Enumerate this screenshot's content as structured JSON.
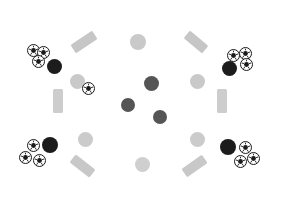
{
  "scene": {
    "title": "Scattered Sports Objects",
    "width": 284,
    "height": 217,
    "background_color": "#ffffff",
    "object_counts": {
      "soccer_balls": 10,
      "dark_balls": 8,
      "light_balls": 6,
      "gray_bars": 6
    }
  },
  "palette": {
    "soccer_ball_fill": "#fdfdfd",
    "soccer_ball_outline": "#1b1b1b",
    "dark_ball_black": "#1c1c1c",
    "dark_ball_gray": "#555555",
    "light_ball": "#c9c9c9",
    "light_ball_pale": "#d6d6d6",
    "bar_gray": "#c4c4c4",
    "bar_gray_light": "#d2d2d2"
  },
  "objects": [
    {
      "id": "soccer-tl-1",
      "kind": "soccer-ball",
      "label": "Soccer ball top-left upper",
      "x": 33,
      "y": 50,
      "size": 13
    },
    {
      "id": "soccer-tl-2",
      "kind": "soccer-ball",
      "label": "Soccer ball top-left right",
      "x": 43,
      "y": 52,
      "size": 13
    },
    {
      "id": "soccer-tl-3",
      "kind": "soccer-ball",
      "label": "Soccer ball top-left lower",
      "x": 38,
      "y": 61,
      "size": 13
    },
    {
      "id": "ball-tl-dark",
      "kind": "dark-ball",
      "label": "Black ball top-left",
      "x": 54,
      "y": 66,
      "size": 15,
      "color": "#1c1c1c"
    },
    {
      "id": "ball-tlm-light",
      "kind": "light-ball",
      "label": "Light ball top-left-mid",
      "x": 77,
      "y": 81,
      "size": 15,
      "color": "#c9c9c9"
    },
    {
      "id": "soccer-tlm",
      "kind": "soccer-ball",
      "label": "Soccer ball top-left-mid",
      "x": 88,
      "y": 88,
      "size": 13
    },
    {
      "id": "bar-top-left",
      "kind": "gray-bar",
      "label": "Gray bar top-left",
      "x": 84,
      "y": 42,
      "w": 26,
      "h": 10,
      "rotate": -34,
      "color": "#c6c6c6"
    },
    {
      "id": "bar-top-right",
      "kind": "gray-bar",
      "label": "Gray bar top-right",
      "x": 196,
      "y": 42,
      "w": 24,
      "h": 10,
      "rotate": 40,
      "color": "#c6c6c6"
    },
    {
      "id": "bar-mid-left",
      "kind": "gray-bar",
      "label": "Gray bar mid-left",
      "x": 58,
      "y": 101,
      "w": 10,
      "h": 24,
      "rotate": 0,
      "color": "#cdcdcd"
    },
    {
      "id": "bar-mid-right",
      "kind": "gray-bar",
      "label": "Gray bar mid-right",
      "x": 222,
      "y": 101,
      "w": 10,
      "h": 24,
      "rotate": 0,
      "color": "#cdcdcd"
    },
    {
      "id": "bar-bot-left",
      "kind": "gray-bar",
      "label": "Gray bar bottom-left",
      "x": 82,
      "y": 166,
      "w": 25,
      "h": 10,
      "rotate": 38,
      "color": "#c8c8c8"
    },
    {
      "id": "bar-bot-right",
      "kind": "gray-bar",
      "label": "Gray bar bottom-right",
      "x": 194,
      "y": 166,
      "w": 25,
      "h": 10,
      "rotate": -35,
      "color": "#c8c8c8"
    },
    {
      "id": "ball-top-center",
      "kind": "light-ball",
      "label": "Light ball top-center",
      "x": 138,
      "y": 42,
      "size": 16,
      "color": "#c9c9c9"
    },
    {
      "id": "ball-mid-c1",
      "kind": "dark-ball",
      "label": "Gray ball center upper",
      "x": 151,
      "y": 83,
      "size": 15,
      "color": "#555555"
    },
    {
      "id": "ball-mid-c2",
      "kind": "dark-ball",
      "label": "Gray ball center left",
      "x": 128,
      "y": 105,
      "size": 14,
      "color": "#555555"
    },
    {
      "id": "ball-mid-c3",
      "kind": "dark-ball",
      "label": "Gray ball center right",
      "x": 160,
      "y": 117,
      "size": 14,
      "color": "#555555"
    },
    {
      "id": "ball-bot-center",
      "kind": "light-ball",
      "label": "Light ball bottom-center",
      "x": 142,
      "y": 164,
      "size": 15,
      "color": "#cfcfcf"
    },
    {
      "id": "ball-trm-light",
      "kind": "light-ball",
      "label": "Light ball top-right-mid",
      "x": 197,
      "y": 81,
      "size": 15,
      "color": "#c9c9c9"
    },
    {
      "id": "soccer-tr-1",
      "kind": "soccer-ball",
      "label": "Soccer ball top-right left",
      "x": 233,
      "y": 55,
      "size": 13
    },
    {
      "id": "soccer-tr-2",
      "kind": "soccer-ball",
      "label": "Soccer ball top-right upper",
      "x": 245,
      "y": 53,
      "size": 13
    },
    {
      "id": "soccer-tr-3",
      "kind": "soccer-ball",
      "label": "Soccer ball top-right lower",
      "x": 246,
      "y": 64,
      "size": 13
    },
    {
      "id": "ball-tr-dark",
      "kind": "dark-ball",
      "label": "Black ball top-right",
      "x": 229,
      "y": 68,
      "size": 15,
      "color": "#1c1c1c"
    },
    {
      "id": "soccer-bl-1",
      "kind": "soccer-ball",
      "label": "Soccer ball bottom-left upper",
      "x": 33,
      "y": 145,
      "size": 13
    },
    {
      "id": "soccer-bl-2",
      "kind": "soccer-ball",
      "label": "Soccer ball bottom-left left",
      "x": 25,
      "y": 157,
      "size": 13
    },
    {
      "id": "soccer-bl-3",
      "kind": "soccer-ball",
      "label": "Soccer ball bottom-left lower",
      "x": 39,
      "y": 160,
      "size": 13
    },
    {
      "id": "ball-bl-dark",
      "kind": "dark-ball",
      "label": "Black ball bottom-left",
      "x": 50,
      "y": 145,
      "size": 16,
      "color": "#1c1c1c"
    },
    {
      "id": "ball-blm-light",
      "kind": "light-ball",
      "label": "Light ball bottom-left-mid",
      "x": 85,
      "y": 139,
      "size": 15,
      "color": "#cbcbcb"
    },
    {
      "id": "ball-brm-light",
      "kind": "light-ball",
      "label": "Light ball bottom-right-mid",
      "x": 197,
      "y": 139,
      "size": 15,
      "color": "#cbcbcb"
    },
    {
      "id": "ball-br-dark",
      "kind": "dark-ball",
      "label": "Black ball bottom-right",
      "x": 228,
      "y": 147,
      "size": 16,
      "color": "#1c1c1c"
    },
    {
      "id": "soccer-br-1",
      "kind": "soccer-ball",
      "label": "Soccer ball bottom-right upper",
      "x": 245,
      "y": 147,
      "size": 13
    },
    {
      "id": "soccer-br-2",
      "kind": "soccer-ball",
      "label": "Soccer ball bottom-right right",
      "x": 253,
      "y": 158,
      "size": 13
    },
    {
      "id": "soccer-br-3",
      "kind": "soccer-ball",
      "label": "Soccer ball bottom-right lower",
      "x": 240,
      "y": 161,
      "size": 13
    }
  ]
}
